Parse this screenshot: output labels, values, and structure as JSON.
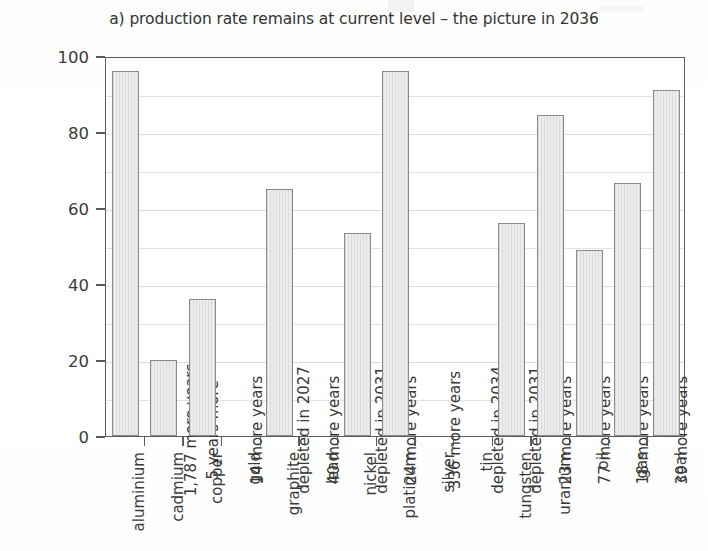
{
  "chart_data": {
    "type": "bar",
    "title": "a) production rate remains at current level – the picture in 2036",
    "xlabel": "",
    "ylabel_line1": "estimated % of resources left",
    "ylabel_line2": "compared with 2011",
    "ylim": [
      0,
      100
    ],
    "yticks": [
      0,
      20,
      40,
      60,
      80,
      100
    ],
    "grid": true,
    "grid_step": 10,
    "legend": "none",
    "categories": [
      "aluminium",
      "cadmium",
      "copper",
      "gold",
      "graphite",
      "lead",
      "nickel",
      "platinum",
      "silver",
      "tin",
      "tungsten",
      "uranium",
      "oil",
      "gas",
      "coal"
    ],
    "values": [
      96,
      20,
      36,
      0,
      65,
      0,
      53.5,
      96,
      0,
      0,
      56,
      84.5,
      49,
      66.5,
      91
    ],
    "annotations": [
      "1,787 more years",
      "5 years more",
      "14 more years",
      "depleted in 2027",
      "40 more years",
      "depleted in 2031",
      "24 more years",
      "336 more years",
      "depleted in 2034",
      "depleted in 2031",
      "23 more years",
      "77 more years",
      "18 more years",
      "39 more years",
      "101 more years"
    ],
    "bar_color": "#e3e3e3",
    "bar_edge_color": "#8a8a8a",
    "grid_color": "#e2e2e2",
    "axis_color": "#5b5b5b",
    "text_color": "#3a3a3a"
  }
}
